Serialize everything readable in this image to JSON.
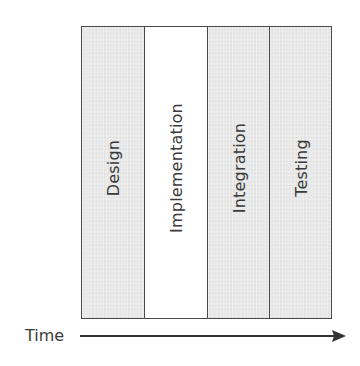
{
  "diagram": {
    "type": "waterfall-phases",
    "phases": [
      {
        "label": "Design",
        "fill": "#e8e8e8"
      },
      {
        "label": "Implementation",
        "fill": "#ffffff"
      },
      {
        "label": "Integration",
        "fill": "#e8e8e8"
      },
      {
        "label": "Testing",
        "fill": "#e8e8e8"
      }
    ],
    "axis": {
      "label": "Time",
      "direction": "right-arrow"
    },
    "colors": {
      "border": "#4a4a4a",
      "text": "#3a3a3a",
      "gray_fill": "#e8e8e8",
      "white_fill": "#ffffff"
    }
  }
}
